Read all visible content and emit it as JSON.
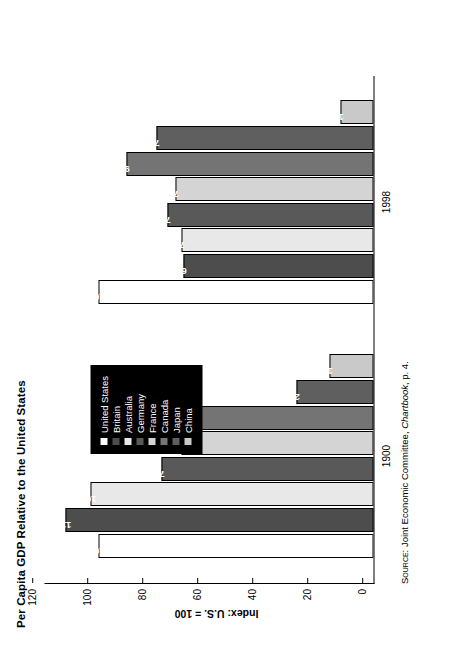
{
  "chart_data": {
    "type": "bar",
    "title": "Per Capita GDP Relative to the United States",
    "xlabel": "",
    "ylabel": "Index: U.S. = 100",
    "ylim": [
      0,
      120
    ],
    "yticks": [
      0,
      20,
      40,
      60,
      80,
      100,
      120
    ],
    "grid": false,
    "legend_position": "inside-center",
    "orientation": "vertical-bars-rotated-90",
    "categories": [
      "1900",
      "1998"
    ],
    "series": [
      {
        "name": "United States",
        "color": "#ffffff",
        "values": [
          100,
          100
        ]
      },
      {
        "name": "Britain",
        "color": "#4d4d4d",
        "values": [
          112,
          69
        ]
      },
      {
        "name": "Australia",
        "color": "#e8e8e8",
        "values": [
          103,
          70
        ]
      },
      {
        "name": "Germany",
        "color": "#595959",
        "values": [
          77,
          75
        ]
      },
      {
        "name": "France",
        "color": "#d4d4d4",
        "values": [
          70,
          72
        ]
      },
      {
        "name": "Canada",
        "color": "#747474",
        "values": [
          66,
          90
        ]
      },
      {
        "name": "Japan",
        "color": "#5f5f5f",
        "values": [
          28,
          79
        ]
      },
      {
        "name": "China",
        "color": "#c9c9c9",
        "values": [
          16,
          12
        ]
      }
    ],
    "data_labels": {
      "1900": [
        "100",
        "112",
        "103",
        "77",
        "70",
        "66",
        "28",
        "16"
      ],
      "1998": [
        "100",
        "69",
        "70",
        "75",
        "72",
        "90",
        "79",
        "12"
      ]
    }
  },
  "source": {
    "prefix": "Source:",
    "body": " Joint Economic Committee, ",
    "italic": "Chartbook",
    "suffix": ", p. 4."
  }
}
